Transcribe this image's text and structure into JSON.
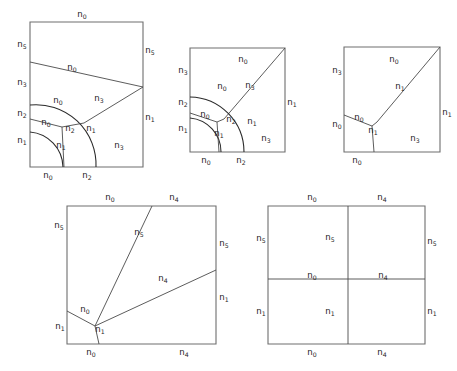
{
  "figure": {
    "title": "",
    "background_color": "#ffffff",
    "frame_color": "#6e6e6e",
    "line_color": "#4a4a4a",
    "arc_color": "#2b2b2b",
    "text_color": "#262626",
    "panel_count": 5
  },
  "panels": [
    {
      "id": "panel-1",
      "position": "top-left",
      "rect": {
        "x": 30,
        "y": 22,
        "w": 113,
        "h": 145
      },
      "description": "Square cell subdivided by two concentric circular arcs and straight cut lines into six labelled regions",
      "labels": [
        {
          "name": "p1-top-n0",
          "text": "n0",
          "base": "n",
          "sub": "0",
          "x": 82,
          "y": 17,
          "anchor": "middle"
        },
        {
          "name": "p1-left-n5",
          "text": "n5",
          "base": "n",
          "sub": "5",
          "x": 22,
          "y": 47,
          "anchor": "middle"
        },
        {
          "name": "p1-right-n5",
          "text": "n5",
          "base": "n",
          "sub": "5",
          "x": 150,
          "y": 53,
          "anchor": "middle"
        },
        {
          "name": "p1-inner-n0-a",
          "text": "n0",
          "base": "n",
          "sub": "0",
          "x": 72,
          "y": 70,
          "anchor": "middle"
        },
        {
          "name": "p1-left-n3",
          "text": "n3",
          "base": "n",
          "sub": "3",
          "x": 22,
          "y": 85,
          "anchor": "middle"
        },
        {
          "name": "p1-inner-n0-b",
          "text": "n0",
          "base": "n",
          "sub": "0",
          "x": 58,
          "y": 103,
          "anchor": "middle"
        },
        {
          "name": "p1-inner-n3",
          "text": "n3",
          "base": "n",
          "sub": "3",
          "x": 99,
          "y": 101,
          "anchor": "middle"
        },
        {
          "name": "p1-left-n2",
          "text": "n2",
          "base": "n",
          "sub": "2",
          "x": 22,
          "y": 116,
          "anchor": "middle"
        },
        {
          "name": "p1-right-n1",
          "text": "n1",
          "base": "n",
          "sub": "1",
          "x": 150,
          "y": 120,
          "anchor": "middle"
        },
        {
          "name": "p1-inner-n0-c",
          "text": "n0",
          "base": "n",
          "sub": "0",
          "x": 46,
          "y": 125,
          "anchor": "middle"
        },
        {
          "name": "p1-inner-n2",
          "text": "n2",
          "base": "n",
          "sub": "2",
          "x": 70,
          "y": 131,
          "anchor": "middle"
        },
        {
          "name": "p1-inner-n1-a",
          "text": "n1",
          "base": "n",
          "sub": "1",
          "x": 91,
          "y": 131,
          "anchor": "middle"
        },
        {
          "name": "p1-left-n1",
          "text": "n1",
          "base": "n",
          "sub": "1",
          "x": 22,
          "y": 143,
          "anchor": "middle"
        },
        {
          "name": "p1-inner-n1-b",
          "text": "n1",
          "base": "n",
          "sub": "1",
          "x": 61,
          "y": 148,
          "anchor": "middle"
        },
        {
          "name": "p1-inner-n3-b",
          "text": "n3",
          "base": "n",
          "sub": "3",
          "x": 119,
          "y": 148,
          "anchor": "middle"
        },
        {
          "name": "p1-bottom-n0",
          "text": "n0",
          "base": "n",
          "sub": "0",
          "x": 48,
          "y": 178,
          "anchor": "middle"
        },
        {
          "name": "p1-bottom-n2",
          "text": "n2",
          "base": "n",
          "sub": "2",
          "x": 87,
          "y": 178,
          "anchor": "middle"
        }
      ]
    },
    {
      "id": "panel-2",
      "position": "top-middle",
      "rect": {
        "x": 190,
        "y": 48,
        "w": 95,
        "h": 104
      },
      "description": "Square cell with concentric arcs and a diagonal cut from the lower-left junction to the upper-right corner",
      "labels": [
        {
          "name": "p2-top-n0",
          "text": "n0",
          "base": "n",
          "sub": "0",
          "x": 243,
          "y": 62,
          "anchor": "middle"
        },
        {
          "name": "p2-left-n3",
          "text": "n3",
          "base": "n",
          "sub": "3",
          "x": 183,
          "y": 73,
          "anchor": "middle"
        },
        {
          "name": "p2-inner-n3",
          "text": "n3",
          "base": "n",
          "sub": "3",
          "x": 250,
          "y": 88,
          "anchor": "middle"
        },
        {
          "name": "p2-inner-n0-a",
          "text": "n0",
          "base": "n",
          "sub": "0",
          "x": 222,
          "y": 89,
          "anchor": "middle"
        },
        {
          "name": "p2-left-n2",
          "text": "n2",
          "base": "n",
          "sub": "2",
          "x": 183,
          "y": 105,
          "anchor": "middle"
        },
        {
          "name": "p2-right-n1",
          "text": "n1",
          "base": "n",
          "sub": "1",
          "x": 292,
          "y": 105,
          "anchor": "middle"
        },
        {
          "name": "p2-inner-n0-b",
          "text": "n0",
          "base": "n",
          "sub": "0",
          "x": 205,
          "y": 117,
          "anchor": "middle"
        },
        {
          "name": "p2-inner-n2",
          "text": "n2",
          "base": "n",
          "sub": "2",
          "x": 231,
          "y": 122,
          "anchor": "middle"
        },
        {
          "name": "p2-inner-n1-a",
          "text": "n1",
          "base": "n",
          "sub": "1",
          "x": 252,
          "y": 124,
          "anchor": "middle"
        },
        {
          "name": "p2-left-n1",
          "text": "n1",
          "base": "n",
          "sub": "1",
          "x": 183,
          "y": 131,
          "anchor": "middle"
        },
        {
          "name": "p2-inner-n1-b",
          "text": "n1",
          "base": "n",
          "sub": "1",
          "x": 219,
          "y": 136,
          "anchor": "middle"
        },
        {
          "name": "p2-inner-n3-b",
          "text": "n3",
          "base": "n",
          "sub": "3",
          "x": 266,
          "y": 141,
          "anchor": "middle"
        },
        {
          "name": "p2-bottom-n0",
          "text": "n0",
          "base": "n",
          "sub": "0",
          "x": 206,
          "y": 163,
          "anchor": "middle"
        },
        {
          "name": "p2-bottom-n2",
          "text": "n2",
          "base": "n",
          "sub": "2",
          "x": 241,
          "y": 163,
          "anchor": "middle"
        }
      ]
    },
    {
      "id": "panel-3",
      "position": "top-right",
      "rect": {
        "x": 344,
        "y": 47,
        "w": 96,
        "h": 105
      },
      "description": "Square cell cut by a single diagonal to the upper-right corner plus a small triple junction near the lower-left",
      "labels": [
        {
          "name": "p3-top-n0",
          "text": "n0",
          "base": "n",
          "sub": "0",
          "x": 394,
          "y": 62,
          "anchor": "middle"
        },
        {
          "name": "p3-left-n3",
          "text": "n3",
          "base": "n",
          "sub": "3",
          "x": 337,
          "y": 73,
          "anchor": "middle"
        },
        {
          "name": "p3-inner-n1",
          "text": "n1",
          "base": "n",
          "sub": "1",
          "x": 400,
          "y": 89,
          "anchor": "middle"
        },
        {
          "name": "p3-right-n1",
          "text": "n1",
          "base": "n",
          "sub": "1",
          "x": 447,
          "y": 115,
          "anchor": "middle"
        },
        {
          "name": "p3-inner-n0",
          "text": "n0",
          "base": "n",
          "sub": "0",
          "x": 359,
          "y": 120,
          "anchor": "middle"
        },
        {
          "name": "p3-left-n0",
          "text": "n0",
          "base": "n",
          "sub": "0",
          "x": 337,
          "y": 127,
          "anchor": "middle"
        },
        {
          "name": "p3-inner-n1b",
          "text": "n1",
          "base": "n",
          "sub": "1",
          "x": 373,
          "y": 133,
          "anchor": "middle"
        },
        {
          "name": "p3-inner-n3",
          "text": "n3",
          "base": "n",
          "sub": "3",
          "x": 415,
          "y": 141,
          "anchor": "middle"
        },
        {
          "name": "p3-bottom-n0",
          "text": "n0",
          "base": "n",
          "sub": "0",
          "x": 357,
          "y": 163,
          "anchor": "middle"
        }
      ]
    },
    {
      "id": "panel-4",
      "position": "bottom-left",
      "rect": {
        "x": 67,
        "y": 206,
        "w": 149,
        "h": 138
      },
      "description": "Rectangular cell with two straight cuts radiating from a junction near the lower left to the top edge and the right edge",
      "labels": [
        {
          "name": "p4-top-n0",
          "text": "n0",
          "base": "n",
          "sub": "0",
          "x": 110,
          "y": 200,
          "anchor": "middle"
        },
        {
          "name": "p4-top-n4",
          "text": "n4",
          "base": "n",
          "sub": "4",
          "x": 174,
          "y": 200,
          "anchor": "middle"
        },
        {
          "name": "p4-left-n5",
          "text": "n5",
          "base": "n",
          "sub": "5",
          "x": 59,
          "y": 228,
          "anchor": "middle"
        },
        {
          "name": "p4-inner-n5",
          "text": "n5",
          "base": "n",
          "sub": "5",
          "x": 139,
          "y": 235,
          "anchor": "middle"
        },
        {
          "name": "p4-right-n5",
          "text": "n5",
          "base": "n",
          "sub": "5",
          "x": 224,
          "y": 246,
          "anchor": "middle"
        },
        {
          "name": "p4-inner-n4",
          "text": "n4",
          "base": "n",
          "sub": "4",
          "x": 163,
          "y": 281,
          "anchor": "middle"
        },
        {
          "name": "p4-right-n1",
          "text": "n1",
          "base": "n",
          "sub": "1",
          "x": 224,
          "y": 300,
          "anchor": "middle"
        },
        {
          "name": "p4-inner-n0",
          "text": "n0",
          "base": "n",
          "sub": "0",
          "x": 85,
          "y": 312,
          "anchor": "middle"
        },
        {
          "name": "p4-left-n1",
          "text": "n1",
          "base": "n",
          "sub": "1",
          "x": 60,
          "y": 329,
          "anchor": "middle"
        },
        {
          "name": "p4-inner-n1",
          "text": "n1",
          "base": "n",
          "sub": "1",
          "x": 100,
          "y": 332,
          "anchor": "middle"
        },
        {
          "name": "p4-bottom-n0",
          "text": "n0",
          "base": "n",
          "sub": "0",
          "x": 91,
          "y": 355,
          "anchor": "middle"
        },
        {
          "name": "p4-bottom-n4",
          "text": "n4",
          "base": "n",
          "sub": "4",
          "x": 184,
          "y": 355,
          "anchor": "middle"
        }
      ]
    },
    {
      "id": "panel-5",
      "position": "bottom-right",
      "rect": {
        "x": 268,
        "y": 206,
        "w": 157,
        "h": 138
      },
      "description": "Rectangular cell divided into four quadrants by one vertical and one horizontal straight cut",
      "labels": [
        {
          "name": "p5-top-n0",
          "text": "n0",
          "base": "n",
          "sub": "0",
          "x": 312,
          "y": 200,
          "anchor": "middle"
        },
        {
          "name": "p5-top-n4",
          "text": "n4",
          "base": "n",
          "sub": "4",
          "x": 382,
          "y": 200,
          "anchor": "middle"
        },
        {
          "name": "p5-left-n5",
          "text": "n5",
          "base": "n",
          "sub": "5",
          "x": 261,
          "y": 241,
          "anchor": "middle"
        },
        {
          "name": "p5-inner-n5",
          "text": "n5",
          "base": "n",
          "sub": "5",
          "x": 330,
          "y": 240,
          "anchor": "middle"
        },
        {
          "name": "p5-right-n5",
          "text": "n5",
          "base": "n",
          "sub": "5",
          "x": 432,
          "y": 244,
          "anchor": "middle"
        },
        {
          "name": "p5-inner-n0",
          "text": "n0",
          "base": "n",
          "sub": "0",
          "x": 312,
          "y": 278,
          "anchor": "middle"
        },
        {
          "name": "p5-inner-n4",
          "text": "n4",
          "base": "n",
          "sub": "4",
          "x": 383,
          "y": 278,
          "anchor": "middle"
        },
        {
          "name": "p5-left-n1",
          "text": "n1",
          "base": "n",
          "sub": "1",
          "x": 261,
          "y": 314,
          "anchor": "middle"
        },
        {
          "name": "p5-inner-n1",
          "text": "n1",
          "base": "n",
          "sub": "1",
          "x": 330,
          "y": 314,
          "anchor": "middle"
        },
        {
          "name": "p5-right-n1",
          "text": "n1",
          "base": "n",
          "sub": "1",
          "x": 432,
          "y": 314,
          "anchor": "middle"
        },
        {
          "name": "p5-bottom-n0",
          "text": "n0",
          "base": "n",
          "sub": "0",
          "x": 312,
          "y": 355,
          "anchor": "middle"
        },
        {
          "name": "p5-bottom-n4",
          "text": "n4",
          "base": "n",
          "sub": "4",
          "x": 382,
          "y": 355,
          "anchor": "middle"
        }
      ]
    }
  ],
  "geometry": {
    "panel1": {
      "frame": "M30,22 L143,22 L143,167 L30,167 Z",
      "cut_upper": "M30,62 L143,87",
      "cut_diagonal": "M143,87 L84,123",
      "arc_outer": "M30,105 A60,60 0 0 1 96,167",
      "arc_inner": "M30,132 A36,36 0 0 1 63,167",
      "spur_upper": "M30,119 L62,127",
      "spur_lower": "M62,127 L84,123",
      "spur_down": "M62,127 L64,167"
    },
    "panel2": {
      "frame": "M190,48 L285,48 L285,152 L190,152 Z",
      "cut_diagonal": "M285,48 L224,119",
      "arc_outer": "M190,97 A55,55 0 0 1 244,152",
      "arc_inner": "M190,118 A34,34 0 0 1 221,152",
      "spur_upper": "M190,113 L217,122",
      "spur_lower": "M217,122 L224,119",
      "spur_down": "M217,122 L219,152"
    },
    "panel3": {
      "frame": "M344,47 L440,47 L440,152 L344,152 Z",
      "cut_diagonal": "M440,47 L377,122",
      "spur_upper": "M344,115 L372,126",
      "spur_lower": "M372,126 L377,122",
      "spur_down": "M372,126 L374,152"
    },
    "panel4": {
      "frame": "M67,206 L216,206 L216,344 L67,344 Z",
      "cut_to_top": "M95,326 L152,206",
      "cut_to_right": "M95,326 L216,270",
      "spur_left": "M67,311 L95,326",
      "spur_down": "M95,326 L99,344"
    },
    "panel5": {
      "frame": "M268,206 L425,206 L425,344 L268,344 Z",
      "cut_vertical": "M348,206 L348,344",
      "cut_horizontal": "M268,279 L425,279"
    }
  }
}
